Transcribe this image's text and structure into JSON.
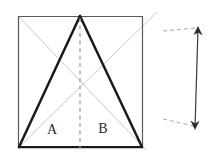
{
  "figure": {
    "background_color": "#ffffff",
    "width": 211,
    "height": 163
  },
  "colors": {
    "square_outline": "#2b2b2b",
    "triangle_stroke": "#1a1a1a",
    "diagonal_stroke": "#c9c9c9",
    "centerline_stroke": "#9a9a9a",
    "dimension_stroke": "#3a3a3a",
    "leader_stroke": "#b0b0b0",
    "label_text": "#2b2b2b"
  },
  "square": {
    "name": "outer-square",
    "left": 18,
    "top": 16,
    "right": 143,
    "bottom": 148,
    "stroke_width": 1.4
  },
  "triangle": {
    "name": "inscribed-triangle",
    "apex": {
      "x": 80,
      "y": 16
    },
    "base_left": {
      "x": 19,
      "y": 147
    },
    "base_right": {
      "x": 142,
      "y": 147
    },
    "stroke_width": 2.6
  },
  "diagonals": [
    {
      "name": "diagonal-tl-br",
      "x1": 19,
      "y1": 17,
      "x2": 146,
      "y2": 150
    },
    {
      "name": "diagonal-bl-tr",
      "x1": 19,
      "y1": 147,
      "x2": 157,
      "y2": 12
    }
  ],
  "centerline": {
    "name": "vertical-centerline",
    "x": 80,
    "y1": 18,
    "y2": 148,
    "dash": "4,3.5"
  },
  "labels": [
    {
      "name": "region-label-a",
      "text": "A",
      "x": 52,
      "y": 131
    },
    {
      "name": "region-label-b",
      "text": "B",
      "x": 103,
      "y": 130
    }
  ],
  "dimension": {
    "name": "height-dimension",
    "arrow_top": {
      "x": 198,
      "y": 27
    },
    "arrow_bottom": {
      "x": 195,
      "y": 129
    },
    "stroke_width": 1.3,
    "leaders": [
      {
        "name": "leader-line-top",
        "x1": 163,
        "y1": 31,
        "x2": 196,
        "y2": 28,
        "dash": "4,3"
      },
      {
        "name": "leader-line-bottom",
        "x1": 163,
        "y1": 119,
        "x2": 194,
        "y2": 126,
        "dash": "4,3"
      }
    ]
  }
}
